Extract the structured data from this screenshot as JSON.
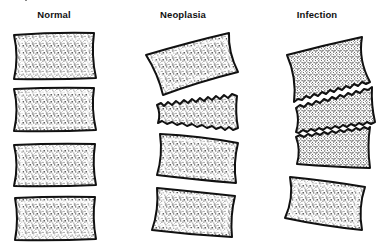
{
  "figure": {
    "colors": {
      "outline": "#111111",
      "stipple": "#333333",
      "background": "#ffffff"
    }
  },
  "columns": [
    {
      "id": "normal",
      "title": "Normal",
      "center_x": 54,
      "vertebrae": [
        {
          "label": "Normal vertebral body 1",
          "endplates": "intact"
        },
        {
          "label": "Normal vertebral body 2",
          "endplates": "intact"
        },
        {
          "label": "Normal vertebral body 3",
          "endplates": "intact"
        },
        {
          "label": "Normal vertebral body 4",
          "endplates": "intact"
        }
      ],
      "disc_spaces": "preserved"
    },
    {
      "id": "neoplasia",
      "title": "Neoplasia",
      "center_x": 183,
      "vertebrae": [
        {
          "label": "Neoplasia vertebral body 1",
          "endplates": "intact, tilted"
        },
        {
          "label": "Neoplasia vertebral body 2",
          "endplates": "destroyed / collapsed (wedge)"
        },
        {
          "label": "Neoplasia vertebral body 3",
          "endplates": "intact"
        },
        {
          "label": "Neoplasia vertebral body 4",
          "endplates": "intact"
        }
      ],
      "disc_spaces": "preserved"
    },
    {
      "id": "infection",
      "title": "Infection",
      "center_x": 317,
      "vertebrae": [
        {
          "label": "Infection vertebral body 1",
          "endplates": "lower endplate eroded"
        },
        {
          "label": "Infection vertebral body 2",
          "endplates": "both endplates eroded"
        },
        {
          "label": "Infection vertebral body 3",
          "endplates": "upper endplate eroded"
        },
        {
          "label": "Infection vertebral body 4",
          "endplates": "intact"
        }
      ],
      "disc_spaces": "narrowed / destroyed"
    }
  ]
}
